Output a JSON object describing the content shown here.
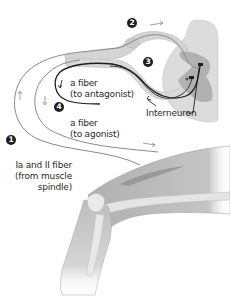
{
  "labels": {
    "alpha_antagonist": {
      "line1": "a fiber",
      "line2": "(to antagonist)"
    },
    "alpha_agonist": {
      "line1": "a fiber",
      "line2": "(to agonist)"
    },
    "afferent": {
      "line1": "Ia and II fiber",
      "line2": "(from muscle",
      "line3": "spindle)"
    },
    "interneuron": "Interneuron"
  },
  "steps": [
    "1",
    "2",
    "3",
    "4"
  ],
  "colors": {
    "background": "#ffffff",
    "nerve_sheath": "#d4d4d4",
    "nerve_sheath_edge": "#b8b8b8",
    "gray_matter": "#a9a9a9",
    "white_matter": "#dcdcdc",
    "fiber_dark": "#1e1e1e",
    "fiber_gray": "#8a8a8a",
    "muscle": "#b5b5b5",
    "bone": "#e4e4e4",
    "text": "#2a2a2a"
  }
}
